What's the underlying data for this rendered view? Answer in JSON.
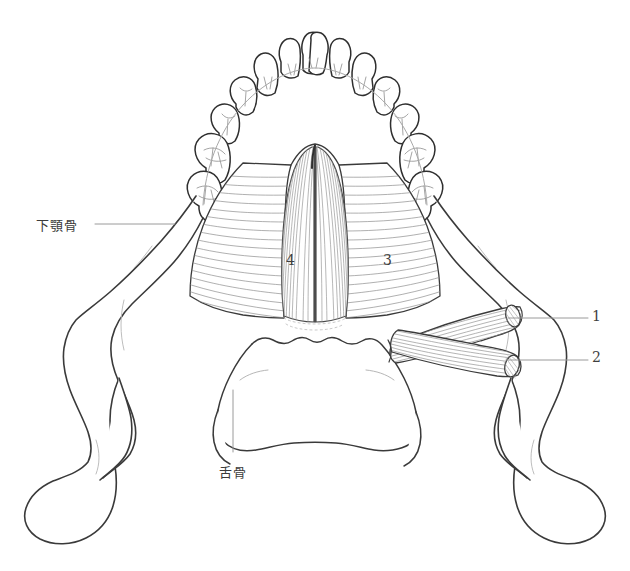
{
  "figure": {
    "background_color": "#ffffff",
    "outline_color": "#3a3a3a",
    "fiber_color": "#8a8a8a",
    "leader_color": "#9a9a9a",
    "text_color": "#3b3b3b"
  },
  "labels": {
    "mandible": "下顎骨",
    "hyoid": "舌骨",
    "num_1": "1",
    "num_2": "2",
    "num_3": "3",
    "num_4": "4"
  },
  "structures": [
    {
      "id": "1",
      "callout": "1",
      "kind": "cut-muscle-belly"
    },
    {
      "id": "2",
      "callout": "2",
      "kind": "cut-muscle-belly"
    },
    {
      "id": "3",
      "callout": "3",
      "kind": "muscle-right-of-raphe"
    },
    {
      "id": "4",
      "callout": "4",
      "kind": "muscle-left-of-raphe"
    },
    {
      "id": "mandible",
      "callout": "下顎骨",
      "kind": "bone"
    },
    {
      "id": "hyoid",
      "callout": "舌骨",
      "kind": "bone"
    }
  ]
}
